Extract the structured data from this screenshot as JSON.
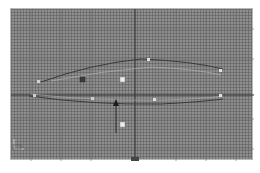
{
  "viewport": {
    "name": "viewport",
    "background": "#8e8e8e",
    "grid_color": "#5a5a5a",
    "axis_color": "#2e2e2e",
    "curve_color": "#3c3c3c",
    "highlight_color": "#c8c8c8",
    "axis_tripod_label": "",
    "selected_vertex_color": "#3a3a3a",
    "vertex_color": "#e8e8e8"
  },
  "caption": {
    "text": ""
  }
}
